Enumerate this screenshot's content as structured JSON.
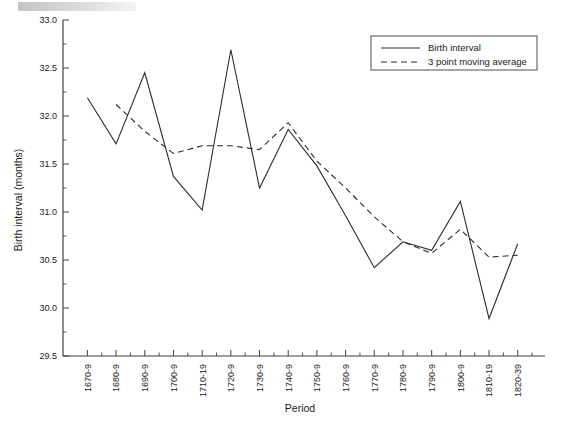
{
  "figure": {
    "background": "#ffffff",
    "line_color": "#2b2b2b"
  },
  "axis": {
    "ylabel": "Birth interval (months)",
    "xlabel": "Period",
    "ytick_labels": [
      "33.0",
      "32.5",
      "32.0",
      "31.5",
      "31.0",
      "30.5",
      "30.0",
      "29.5"
    ],
    "xtick_labels": [
      "1670-9",
      "1680-9",
      "1690-9",
      "1700-9",
      "1710-19",
      "1720-9",
      "1730-9",
      "1740-9",
      "1750-9",
      "1760-9",
      "1770-9",
      "1780-9",
      "1790-9",
      "1800-9",
      "1810-19",
      "1820-39"
    ]
  },
  "legend": {
    "items": [
      {
        "label": "Birth interval",
        "style": "solid"
      },
      {
        "label": "3 point moving average",
        "style": "dashed"
      }
    ]
  },
  "chart_data": {
    "type": "line",
    "title": "",
    "xlabel": "Period",
    "ylabel": "Birth interval (months)",
    "ylim": [
      29.5,
      33.0
    ],
    "ytick_step": 0.5,
    "yminor_step": 0.25,
    "grid": false,
    "legend_position": "top-right",
    "categories": [
      "1670-9",
      "1680-9",
      "1690-9",
      "1700-9",
      "1710-19",
      "1720-9",
      "1730-9",
      "1740-9",
      "1750-9",
      "1760-9",
      "1770-9",
      "1780-9",
      "1790-9",
      "1800-9",
      "1810-19",
      "1820-39"
    ],
    "series": [
      {
        "name": "Birth interval",
        "style": "solid",
        "values": [
          32.19,
          31.71,
          32.45,
          31.37,
          31.02,
          32.69,
          31.25,
          31.86,
          31.48,
          30.96,
          30.42,
          30.69,
          30.6,
          31.11,
          29.89,
          30.67
        ]
      },
      {
        "name": "3 point moving average",
        "style": "dashed",
        "values": [
          null,
          32.12,
          31.84,
          31.61,
          31.69,
          31.69,
          31.65,
          31.93,
          31.53,
          31.25,
          30.95,
          30.69,
          30.57,
          30.82,
          30.53,
          30.55
        ]
      }
    ]
  }
}
